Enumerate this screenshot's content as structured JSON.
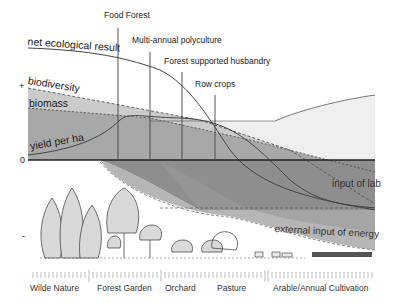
{
  "systems": {
    "food_forest": "Food Forest",
    "multi_annual": "Multi-annual polyculture",
    "forest_husbandry": "Forest supported husbandry",
    "row_crops": "Row crops"
  },
  "curves": {
    "net_ecological_result": "net ecological result",
    "biodiversity": "biodiversity",
    "biomass": "biomass",
    "yield_per_ha": "yield per ha"
  },
  "axis": {
    "plus": "+",
    "zero": "0",
    "minus": "-"
  },
  "bands": {
    "input_of_labour": "input of lab",
    "external_energy": "external input of energy"
  },
  "scale": {
    "wilde_nature": "Wilde Nature",
    "forest_garden": "Forest Garden",
    "orchard": "Orchard",
    "pasture": "Pasture",
    "arable": "Arable/Annual Cultivation"
  },
  "colors": {
    "light_band": "#ececec",
    "biodiversity_band": "#c9c9c9",
    "biomass_band": "#a9a9a9",
    "labour_band": "#8c8c8c",
    "energy_band": "#b4b4b4",
    "line": "#444444",
    "tree_fill": "#d9d9d9"
  }
}
